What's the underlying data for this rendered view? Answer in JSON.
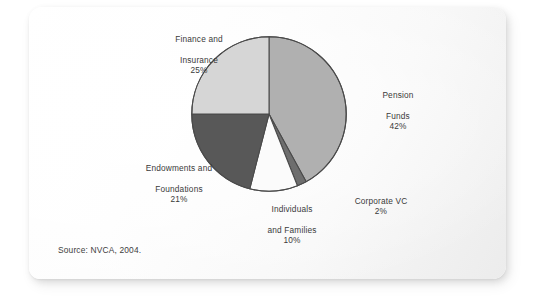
{
  "figure": {
    "source_note": "Source: NVCA, 2004.",
    "background_color": "#ffffff",
    "card_color": "#fbfbfb"
  },
  "chart_data": {
    "type": "pie",
    "title": "",
    "subtitle": "",
    "xlabel": "",
    "ylabel": "",
    "legend_position": "none",
    "labels_position": "outside",
    "grid": false,
    "start_angle_deg": 0,
    "direction": "clockwise",
    "unit": "%",
    "categories": [
      "Pension Funds",
      "Corporate VC",
      "Individuals and Families",
      "Endowments and Foundations",
      "Finance and Insurance"
    ],
    "values": [
      42,
      2,
      10,
      21,
      25
    ],
    "colors": [
      "#b0b0b0",
      "#6e6e6e",
      "#fbfbfb",
      "#585858",
      "#d6d6d6"
    ],
    "slices": [
      {
        "name": "Pension Funds",
        "label_line1": "Pension",
        "label_line2": "Funds",
        "value": 42,
        "percent_text": "42%",
        "color": "#b0b0b0"
      },
      {
        "name": "Corporate VC",
        "label_line1": "Corporate VC",
        "label_line2": "",
        "value": 2,
        "percent_text": "2%",
        "color": "#6e6e6e"
      },
      {
        "name": "Individuals and Families",
        "label_line1": "Individuals",
        "label_line2": "and Families",
        "value": 10,
        "percent_text": "10%",
        "color": "#fbfbfb"
      },
      {
        "name": "Endowments and Foundations",
        "label_line1": "Endowments and",
        "label_line2": "Foundations",
        "value": 21,
        "percent_text": "21%",
        "color": "#585858"
      },
      {
        "name": "Finance and Insurance",
        "label_line1": "Finance and",
        "label_line2": "Insurance",
        "value": 25,
        "percent_text": "25%",
        "color": "#d6d6d6"
      }
    ]
  }
}
